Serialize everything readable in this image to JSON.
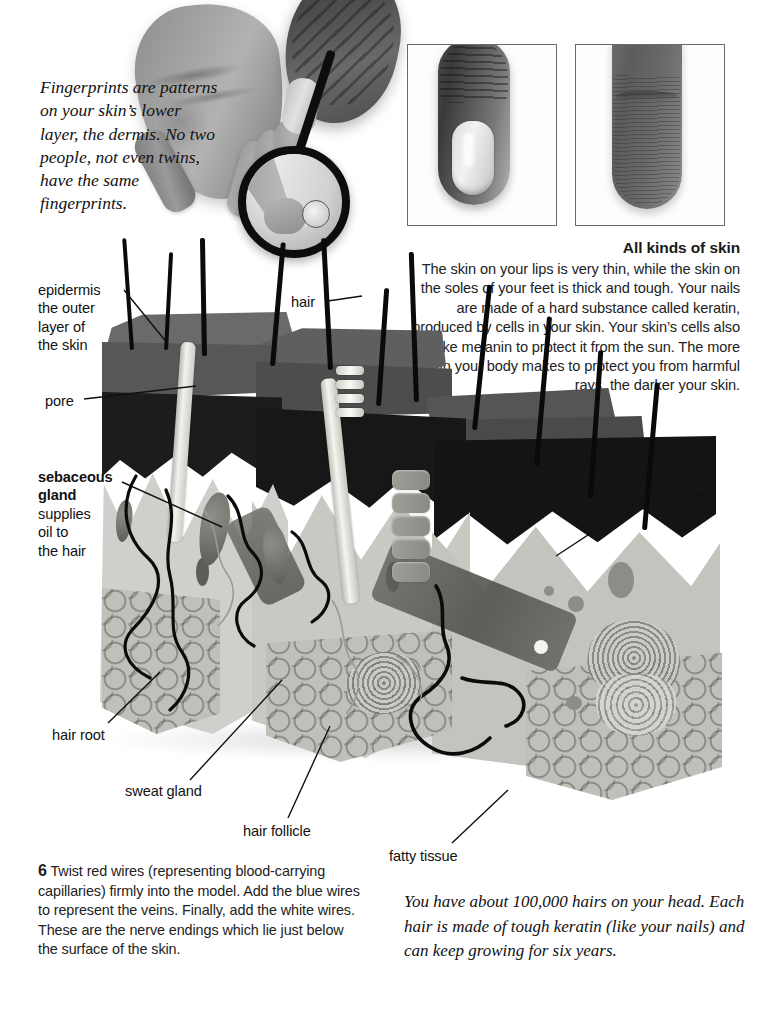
{
  "page": {
    "background_color": "#ffffff",
    "ink_color": "#1a1a1a"
  },
  "fingerprint_caption": {
    "text": "Fingerprints are patterns on your skin’s lower layer, the dermis. No two people, not even twins, have the same fingerprints."
  },
  "photos": {
    "hands_with_magnifier": "photo-hands-magnifying-glass",
    "fingertip_nail": "photo-fingertip-with-nail",
    "fingertip_pad": "photo-fingertip-pad"
  },
  "all_kinds_of_skin": {
    "heading": "All kinds of skin",
    "body": "The skin on your lips is very thin, while the skin on the soles of your feet is thick and tough. Your nails are made of a hard substance called keratin, produced by cells in your skin. Your skin’s cells also make melanin to protect it from the sun. The more melanin your body makes to protect you from harmful rays, the darker your skin."
  },
  "labels": [
    {
      "id": "epidermis",
      "title": "epidermis",
      "description": "the outer layer of the skin"
    },
    {
      "id": "pore",
      "title": "pore",
      "description": ""
    },
    {
      "id": "sebaceous-gland",
      "title": "sebaceous gland",
      "description": "supplies oil to the hair"
    },
    {
      "id": "hair",
      "title": "hair",
      "description": ""
    },
    {
      "id": "muscle",
      "title": "muscle",
      "description": ""
    },
    {
      "id": "hair-root",
      "title": "hair root",
      "description": ""
    },
    {
      "id": "sweat-gland",
      "title": "sweat gland",
      "description": ""
    },
    {
      "id": "hair-follicle",
      "title": "hair follicle",
      "description": ""
    },
    {
      "id": "fatty-tissue",
      "title": "fatty tissue",
      "description": ""
    }
  ],
  "label_text": {
    "epidermis_title": "epidermis",
    "epidermis_line1": "the outer",
    "epidermis_line2": "layer of",
    "epidermis_line3": "the skin",
    "pore": "pore",
    "sebaceous_title1": "sebaceous",
    "sebaceous_title2": "gland",
    "sebaceous_line1": "supplies",
    "sebaceous_line2": "oil to",
    "sebaceous_line3": "the hair",
    "hair": "hair",
    "muscle": "muscle",
    "hair_root": "hair root",
    "sweat_gland": "sweat gland",
    "hair_follicle": "hair follicle",
    "fatty_tissue": "fatty tissue"
  },
  "step": {
    "number": "6",
    "text": "Twist red wires (representing blood-carrying capillaries) firmly into the model. Add the blue wires to represent the veins. Finally, add the white wires. These are the nerve endings which lie just below the surface of the skin."
  },
  "hair_fact": {
    "text": "You have about 100,000 hairs on your head. Each hair is made of tough keratin (like your nails) and can keep growing for six years."
  }
}
